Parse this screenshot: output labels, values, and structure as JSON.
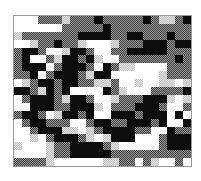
{
  "image": {
    "description": "Pixelated grayscale mosaic / dithered noise pattern inside a thin gray frame",
    "frame_color": "#9a9a9a",
    "palette": {
      "W": "#ffffff",
      "L": "#cfcfcf",
      "G": "#6a6a6a",
      "B": "#0d0d0d"
    },
    "cols": 22,
    "rows": [
      "WWWGGGLGGGBGGGGGBGLLGB",
      "WWWWWWGGGGGBGGGGGGGGGG",
      "LGGGGGGGBBBBGGBBGGGBGG",
      "WWLGGBGGLWWWLGGGBBBGBB",
      "GBBGWWLBBGWWGGBBBBBGGG",
      "GBWWGLBBGBLWWGGGGGGGBG",
      "GBBBWGBBBGWBGLLWWWWGGG",
      "GGBWGBBBGLBBWWWWWWLGGG",
      "WLGBBGBBGGLLGWWLWWLLWL",
      "BBGLBGBWWWWBGLWWWGGGGB",
      "WGBBBGLBBGWWLGGGBBBLWL",
      "WWBBBGGBBBLWGGGBBBGWWG",
      "GBBGWLBBGBWWBBBGBBBWBW",
      "WGBBGGGWWGBBGGBBBGBWWB",
      "WWGBBBLLWLGBBBBGGWWBGG",
      "WWLWGBBBGLWLBBBWWWGBBB",
      "LWWWLGGBBBBGLWWWWWGBBB",
      "WWWWLGGBBBBBGGGGGGGGGG",
      "GGGGLWWWWWWLLGGWGLWWGW"
    ]
  }
}
